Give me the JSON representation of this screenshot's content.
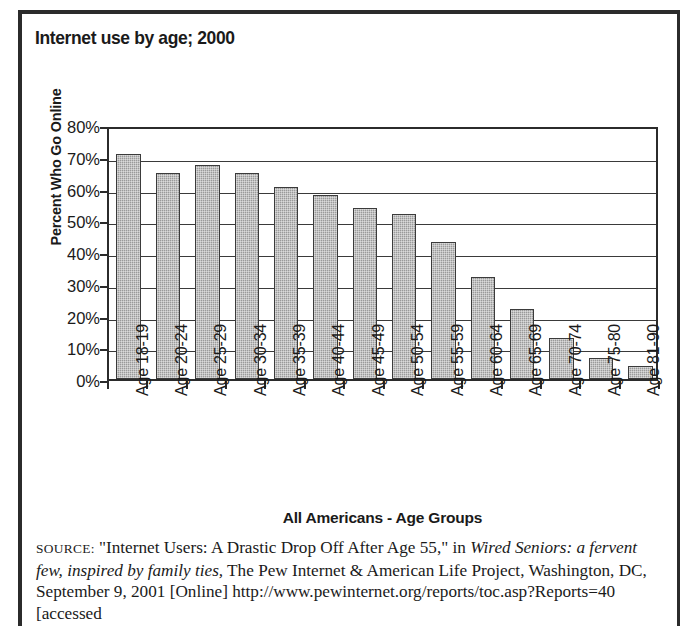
{
  "figure": {
    "title": "Internet use by age; 2000",
    "source_prefix": "SOURCE:",
    "source_part1": " \"Internet Users: A Drastic Drop Off After Age 55,\" in ",
    "source_italic1": "Wired Seniors: a fervent few, inspired by family ties,",
    "source_part2": " The Pew Internet & American Life Project, Washington, DC, September 9, 2001 [Online] http://www.pewinternet.org/reports/toc.asp?Reports=40 [accessed"
  },
  "chart_data": {
    "type": "bar",
    "title": "Internet use by age; 2000",
    "xlabel": "All Americans - Age Groups",
    "ylabel": "Percent Who Go Online",
    "ylim": [
      0,
      80
    ],
    "ytick_values": [
      0,
      10,
      20,
      30,
      40,
      50,
      60,
      70,
      80
    ],
    "ytick_labels": [
      "0%",
      "10%",
      "20%",
      "30%",
      "40%",
      "50%",
      "60%",
      "70%",
      "80%"
    ],
    "grid": true,
    "legend": "none",
    "bar_color": "#9a9a9a",
    "bar_edge_color": "#3b3b3b",
    "categories": [
      "Age 18-19",
      "Age 20-24",
      "Age 25-29",
      "Age 30-34",
      "Age 35-39",
      "Age 40-44",
      "Age 45-49",
      "Age 50-54",
      "Age 55-59",
      "Age 60-64",
      "Age 65-69",
      "Age 70-74",
      "Age 75-80",
      "Age 81-90"
    ],
    "values": [
      71,
      65,
      67.5,
      65,
      60.5,
      58,
      54,
      52,
      43,
      32,
      22,
      13,
      6.5,
      4
    ]
  }
}
